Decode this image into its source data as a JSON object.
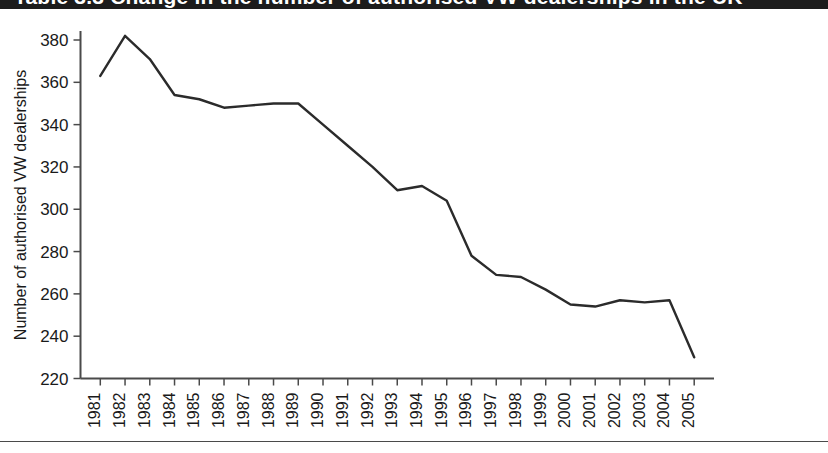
{
  "banner": {
    "title": "Table 3.3  Change in the number of authorised VW dealerships in the UK"
  },
  "chart_data": {
    "type": "line",
    "title": "",
    "xlabel": "",
    "ylabel": "Number of authorised VW dealerships",
    "ylim": [
      220,
      380
    ],
    "yticks": [
      220,
      240,
      260,
      280,
      300,
      320,
      340,
      360,
      380
    ],
    "ytick_labels": [
      "220",
      "240",
      "260",
      "280",
      "300",
      "320",
      "340",
      "360",
      "380"
    ],
    "grid": false,
    "legend": "none",
    "line_color": "#2b2b2b",
    "categories": [
      "1981",
      "1982",
      "1983",
      "1984",
      "1985",
      "1986",
      "1987",
      "1988",
      "1989",
      "1990",
      "1991",
      "1992",
      "1993",
      "1994",
      "1995",
      "1996",
      "1997",
      "1998",
      "1999",
      "2000",
      "2001",
      "2002",
      "2003",
      "2004",
      "2005"
    ],
    "x": [
      1981,
      1982,
      1983,
      1984,
      1985,
      1986,
      1987,
      1988,
      1989,
      1990,
      1991,
      1992,
      1993,
      1994,
      1995,
      1996,
      1997,
      1998,
      1999,
      2000,
      2001,
      2002,
      2003,
      2004,
      2005
    ],
    "series": [
      {
        "name": "Number of authorised VW dealerships",
        "values": [
          363,
          382,
          371,
          354,
          352,
          348,
          349,
          350,
          350,
          340,
          330,
          320,
          309,
          311,
          304,
          278,
          269,
          268,
          262,
          255,
          254,
          257,
          256,
          257,
          230
        ]
      }
    ]
  }
}
